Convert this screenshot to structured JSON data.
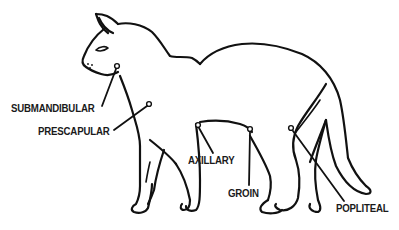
{
  "diagram": {
    "line_color": "#111111",
    "background": "#ffffff",
    "labels": {
      "submandibular": "SUBMANDIBULAR",
      "prescapular": "PRESCAPULAR",
      "axillary": "AXILLARY",
      "groin": "GROIN",
      "popliteal": "POPLITEAL"
    },
    "nodes": [
      {
        "id": "submandibular",
        "label": "SUBMANDIBULAR",
        "x": 117,
        "y": 66
      },
      {
        "id": "prescapular",
        "label": "PRESCAPULAR",
        "x": 149,
        "y": 105
      },
      {
        "id": "axillary",
        "label": "AXILLARY",
        "x": 198,
        "y": 125
      },
      {
        "id": "groin",
        "label": "GROIN",
        "x": 250,
        "y": 130
      },
      {
        "id": "popliteal",
        "label": "POPLITEAL",
        "x": 291,
        "y": 128
      }
    ]
  }
}
